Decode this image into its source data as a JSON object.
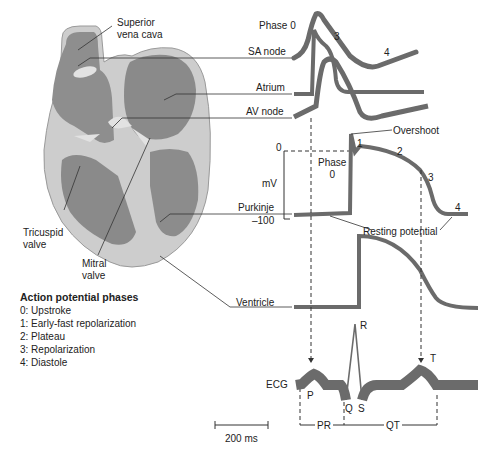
{
  "heart_labels": {
    "superior_vena_cava": "Superior\nvena cava",
    "sa_node": "SA node",
    "atrium": "Atrium",
    "av_node": "AV node",
    "purkinje": "Purkinje",
    "tricuspid_valve": "Tricuspid\nvalve",
    "mitral_valve": "Mitral\nvalve",
    "ventricle": "Ventricle"
  },
  "sa_trace": {
    "phase0": "Phase 0",
    "phase3": "3",
    "phase4": "4"
  },
  "purkinje_trace": {
    "y_top": "0",
    "y_unit": "mV",
    "y_bottom": "–100",
    "phase_label": "Phase\n0",
    "p1": "1",
    "p2": "2",
    "p3": "3",
    "p4": "4",
    "overshoot": "Overshoot",
    "resting": "Resting potential"
  },
  "ecg": {
    "label": "ECG",
    "P": "P",
    "Q": "Q",
    "R": "R",
    "S": "S",
    "T": "T",
    "PR": "PR",
    "QT": "QT"
  },
  "scale_bar": "200 ms",
  "legend": {
    "title": "Action potential phases",
    "items": [
      "0:  Upstroke",
      "1:  Early-fast repolarization",
      "2:  Plateau",
      "3:  Repolarization",
      "4:  Diastole"
    ]
  },
  "colors": {
    "trace": "#6b6b6b",
    "heart_outer": "#c8c8c8",
    "heart_chamber": "#8a8a8a",
    "line": "#333333"
  }
}
